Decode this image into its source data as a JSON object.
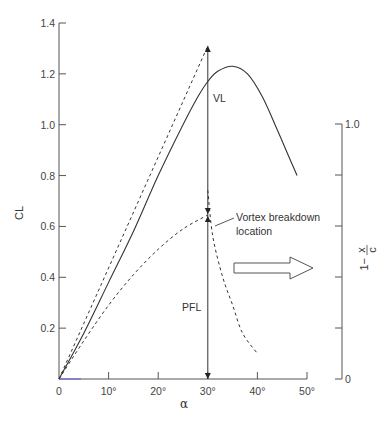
{
  "chart_data": {
    "type": "line",
    "title": "",
    "xlabel": "α",
    "ylabel": "CL",
    "y2label": "1 − x/c",
    "xlim": [
      0,
      50
    ],
    "ylim": [
      0,
      1.4
    ],
    "y2lim": [
      0,
      1.0
    ],
    "grid": false,
    "x_ticks": [
      0,
      10,
      20,
      30,
      40,
      50
    ],
    "x_tick_labels": [
      "0",
      "10°",
      "20°",
      "30°",
      "40°",
      "50°"
    ],
    "y_ticks": [
      0.2,
      0.4,
      0.6,
      0.8,
      1.0,
      1.2,
      1.4
    ],
    "y_tick_labels": [
      "0.2",
      "0.4",
      "0.6",
      "0.8",
      "1.0",
      "1.2",
      "1.4"
    ],
    "y2_ticks": [
      0,
      0.2,
      0.4,
      0.6,
      0.8,
      1.0
    ],
    "y2_tick_labels": [
      "0",
      "",
      "",
      "",
      "",
      "1.0"
    ],
    "series": [
      {
        "name": "Total CL (measured)",
        "style": "solid",
        "x": [
          0,
          5,
          10,
          15,
          20,
          25,
          28,
          30,
          32,
          35,
          38,
          41,
          44,
          46,
          48
        ],
        "y": [
          0,
          0.18,
          0.38,
          0.58,
          0.8,
          1.0,
          1.11,
          1.17,
          1.21,
          1.23,
          1.2,
          1.11,
          0.98,
          0.89,
          0.8
        ]
      },
      {
        "name": "Potential flow + vortex lift (no breakdown)",
        "style": "dashed",
        "x": [
          0,
          30
        ],
        "y": [
          0,
          1.31
        ]
      },
      {
        "name": "Potential flow lift",
        "style": "dashed",
        "x": [
          0,
          5,
          10,
          15,
          20,
          25,
          30
        ],
        "y": [
          0,
          0.15,
          0.29,
          0.41,
          0.51,
          0.59,
          0.645
        ]
      },
      {
        "name": "Vortex breakdown location (1 − x/c)",
        "style": "dashed",
        "axis": "y2",
        "x": [
          30,
          31,
          33,
          35,
          37,
          40
        ],
        "y2": [
          0.74,
          0.56,
          0.4,
          0.29,
          0.18,
          0.1
        ]
      }
    ],
    "annotations": [
      {
        "text": "VL",
        "meaning": "vortex lift",
        "at_alpha": 30,
        "from_CL": 0.645,
        "to_CL": 1.31
      },
      {
        "text": "PFL",
        "meaning": "potential flow lift",
        "at_alpha": 30,
        "from_CL": 0,
        "to_CL": 0.645
      },
      {
        "text": "Vortex breakdown location",
        "pointer_to": [
          30.5,
          0.62
        ]
      },
      {
        "text": "",
        "shape": "hollow arrow pointing right to secondary axis",
        "y_CL": 0.44
      }
    ]
  },
  "labels": {
    "ylabel": "CL",
    "xlabel": "α",
    "y2label_prefix": "1−",
    "y2label_num": "x",
    "y2label_den": "c",
    "vl": "VL",
    "pfl": "PFL",
    "vb_line1": "Vortex breakdown",
    "vb_line2": "location"
  },
  "colors": {
    "axis": "#555555",
    "curve": "#333333",
    "origin_tint": "#6a6ad8"
  }
}
